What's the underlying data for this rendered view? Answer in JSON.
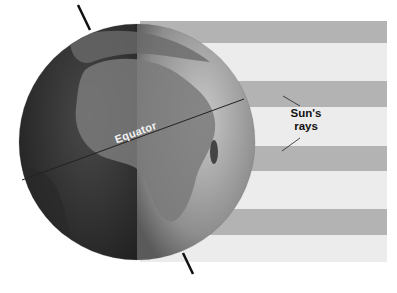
{
  "diagram": {
    "labels": {
      "equator": "Equator",
      "sun_rays_line1": "Sun's",
      "sun_rays_line2": "rays"
    },
    "colors": {
      "ray_dark": "#b3b3b3",
      "ray_light": "#ececec",
      "night_side": "#3a3a3a",
      "day_side": "#9a9a9a",
      "axis": "#111111"
    },
    "rays": [
      {
        "top": 21,
        "height": 22,
        "tone": "dark"
      },
      {
        "top": 43,
        "height": 38,
        "tone": "light"
      },
      {
        "top": 81,
        "height": 26,
        "tone": "dark"
      },
      {
        "top": 107,
        "height": 39,
        "tone": "light"
      },
      {
        "top": 146,
        "height": 25,
        "tone": "dark"
      },
      {
        "top": 171,
        "height": 38,
        "tone": "light"
      },
      {
        "top": 209,
        "height": 26,
        "tone": "dark"
      },
      {
        "top": 235,
        "height": 27,
        "tone": "light"
      }
    ]
  }
}
